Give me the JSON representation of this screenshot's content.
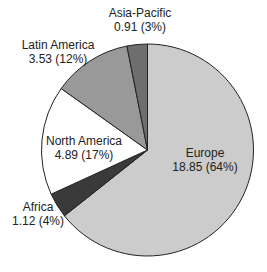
{
  "chart_data": {
    "type": "pie",
    "title": "",
    "start_angle_deg": 0,
    "direction": "clockwise",
    "slices": [
      {
        "name": "Europe",
        "value": 18.85,
        "percent": 64,
        "label_value": "18.85 (64%)",
        "color": "#cccccc"
      },
      {
        "name": "Africa",
        "value": 1.12,
        "percent": 4,
        "label_value": "1.12 (4%)",
        "color": "#3a3a3a"
      },
      {
        "name": "North America",
        "value": 4.89,
        "percent": 17,
        "label_value": "4.89 (17%)",
        "color": "#ffffff"
      },
      {
        "name": "Latin America",
        "value": 3.53,
        "percent": 12,
        "label_value": "3.53 (12%)",
        "color": "#999999"
      },
      {
        "name": "Asia-Pacific",
        "value": 0.91,
        "percent": 3,
        "label_value": "0.91 (3%)",
        "color": "#6e6e6e"
      }
    ],
    "labels": {
      "europe": {
        "name": "Europe",
        "value": "18.85 (64%)"
      },
      "africa": {
        "name": "Africa",
        "value": "1.12 (4%)"
      },
      "north_america": {
        "name": "North America",
        "value": "4.89 (17%)"
      },
      "latin_america": {
        "name": "Latin America",
        "value": "3.53 (12%)"
      },
      "asia_pacific": {
        "name": "Asia-Pacific",
        "value": "0.91 (3%)"
      }
    }
  }
}
